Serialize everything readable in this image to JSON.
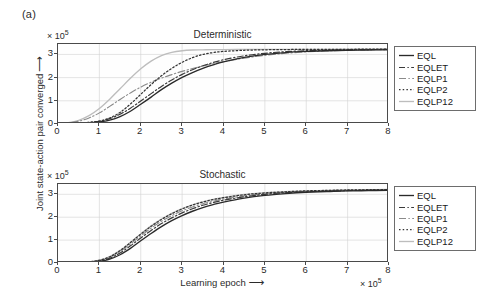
{
  "figure": {
    "panel_label": "(a)",
    "ylabel": "Joint state-action pair converged",
    "ylabel_arrow": "⟶",
    "xlabel": "Learning epoch",
    "xlabel_arrow": "⟶",
    "exponent": "× 10",
    "exponent_sup": "5"
  },
  "series_styles": {
    "EQL": {
      "color": "#2a2a2a",
      "width": 1.35,
      "dash": "none"
    },
    "EQLET": {
      "color": "#3a3a3a",
      "width": 1.2,
      "dash": "6,2.4,1.4,2.4"
    },
    "EQLP1": {
      "color": "#8a8a8a",
      "width": 1.1,
      "dash": "7,2.4,1.4,2.4"
    },
    "EQLP2": {
      "color": "#333333",
      "width": 1.25,
      "dash": "1.5,2.2"
    },
    "EQLP12": {
      "color": "#bdbdbd",
      "width": 1.35,
      "dash": "none"
    }
  },
  "chart_data": [
    {
      "type": "line",
      "title": "Deterministic",
      "xlabel": "Learning epoch",
      "ylabel": "Joint state-action pair converged",
      "x_scale_label": "× 10^5",
      "y_scale_label": "× 10^5",
      "xlim": [
        0,
        8
      ],
      "ylim": [
        0,
        3.45
      ],
      "xticks": [
        0,
        1,
        2,
        3,
        4,
        5,
        6,
        7,
        8
      ],
      "yticks": [
        0,
        1,
        2,
        3
      ],
      "grid": true,
      "legend_position": "right-outside",
      "x": [
        0,
        0.25,
        0.5,
        0.75,
        1.0,
        1.25,
        1.5,
        1.75,
        2.0,
        2.25,
        2.5,
        2.75,
        3.0,
        3.25,
        3.5,
        3.75,
        4.0,
        4.5,
        5.0,
        5.5,
        6.0,
        6.5,
        7.0,
        7.5,
        8.0
      ],
      "series": [
        {
          "name": "EQL",
          "values": [
            0.01,
            0.02,
            0.03,
            0.05,
            0.09,
            0.17,
            0.32,
            0.55,
            0.85,
            1.16,
            1.48,
            1.76,
            2.01,
            2.22,
            2.4,
            2.55,
            2.68,
            2.87,
            3.0,
            3.08,
            3.13,
            3.16,
            3.18,
            3.19,
            3.2
          ]
        },
        {
          "name": "EQLET",
          "values": [
            0.01,
            0.02,
            0.04,
            0.07,
            0.12,
            0.23,
            0.42,
            0.68,
            0.99,
            1.31,
            1.62,
            1.9,
            2.14,
            2.34,
            2.51,
            2.65,
            2.77,
            2.94,
            3.05,
            3.12,
            3.16,
            3.18,
            3.2,
            3.21,
            3.22
          ]
        },
        {
          "name": "EQLP1",
          "values": [
            0.02,
            0.05,
            0.12,
            0.26,
            0.48,
            0.76,
            1.06,
            1.34,
            1.59,
            1.8,
            1.98,
            2.13,
            2.27,
            2.39,
            2.5,
            2.6,
            2.69,
            2.84,
            2.96,
            3.05,
            3.11,
            3.15,
            3.18,
            3.2,
            3.21
          ]
        },
        {
          "name": "EQLP2",
          "values": [
            0.01,
            0.02,
            0.04,
            0.07,
            0.13,
            0.26,
            0.5,
            0.86,
            1.28,
            1.7,
            2.08,
            2.4,
            2.66,
            2.86,
            3.0,
            3.08,
            3.13,
            3.18,
            3.2,
            3.21,
            3.22,
            3.22,
            3.22,
            3.23,
            3.23
          ]
        },
        {
          "name": "EQLP12",
          "values": [
            0.02,
            0.06,
            0.16,
            0.36,
            0.67,
            1.07,
            1.52,
            1.97,
            2.38,
            2.71,
            2.95,
            3.09,
            3.16,
            3.19,
            3.2,
            3.21,
            3.21,
            3.22,
            3.22,
            3.22,
            3.22,
            3.22,
            3.23,
            3.23,
            3.23
          ]
        }
      ]
    },
    {
      "type": "line",
      "title": "Stochastic",
      "xlabel": "Learning epoch",
      "ylabel": "Joint state-action pair converged",
      "x_scale_label": "× 10^5",
      "y_scale_label": "× 10^5",
      "xlim": [
        0,
        8
      ],
      "ylim": [
        0,
        3.45
      ],
      "xticks": [
        0,
        1,
        2,
        3,
        4,
        5,
        6,
        7,
        8
      ],
      "yticks": [
        0,
        1,
        2,
        3
      ],
      "grid": true,
      "legend_position": "right-outside",
      "x": [
        0,
        0.25,
        0.5,
        0.75,
        1.0,
        1.25,
        1.5,
        1.75,
        2.0,
        2.25,
        2.5,
        2.75,
        3.0,
        3.25,
        3.5,
        3.75,
        4.0,
        4.5,
        5.0,
        5.5,
        6.0,
        6.5,
        7.0,
        7.5,
        8.0
      ],
      "series": [
        {
          "name": "EQL",
          "values": [
            0.0,
            0.01,
            0.01,
            0.03,
            0.07,
            0.17,
            0.36,
            0.64,
            0.97,
            1.29,
            1.59,
            1.85,
            2.07,
            2.26,
            2.42,
            2.55,
            2.66,
            2.83,
            2.95,
            3.03,
            3.09,
            3.12,
            3.15,
            3.16,
            3.17
          ]
        },
        {
          "name": "EQLET",
          "values": [
            0.0,
            0.01,
            0.02,
            0.04,
            0.09,
            0.21,
            0.44,
            0.75,
            1.09,
            1.42,
            1.72,
            1.97,
            2.19,
            2.37,
            2.52,
            2.64,
            2.74,
            2.89,
            3.0,
            3.07,
            3.11,
            3.14,
            3.16,
            3.18,
            3.19
          ]
        },
        {
          "name": "EQLP1",
          "values": [
            0.0,
            0.01,
            0.02,
            0.05,
            0.11,
            0.25,
            0.5,
            0.83,
            1.18,
            1.52,
            1.82,
            2.07,
            2.28,
            2.45,
            2.59,
            2.7,
            2.79,
            2.93,
            3.03,
            3.09,
            3.13,
            3.16,
            3.18,
            3.19,
            3.2
          ]
        },
        {
          "name": "EQLP2",
          "values": [
            0.0,
            0.01,
            0.02,
            0.05,
            0.12,
            0.27,
            0.54,
            0.89,
            1.26,
            1.6,
            1.9,
            2.15,
            2.36,
            2.53,
            2.66,
            2.77,
            2.85,
            2.98,
            3.06,
            3.11,
            3.15,
            3.17,
            3.19,
            3.2,
            3.21
          ]
        },
        {
          "name": "EQLP12",
          "values": [
            0.0,
            0.01,
            0.02,
            0.05,
            0.12,
            0.28,
            0.55,
            0.9,
            1.27,
            1.62,
            1.92,
            2.17,
            2.37,
            2.54,
            2.67,
            2.78,
            2.86,
            2.99,
            3.07,
            3.12,
            3.15,
            3.17,
            3.19,
            3.2,
            3.21
          ]
        }
      ]
    }
  ],
  "legend": {
    "entries": [
      {
        "label": "EQL"
      },
      {
        "label": "EQLET"
      },
      {
        "label": "EQLP1"
      },
      {
        "label": "EQLP2"
      },
      {
        "label": "EQLP12"
      }
    ]
  },
  "axes": {
    "xtick_labels": [
      "0",
      "1",
      "2",
      "3",
      "4",
      "5",
      "6",
      "7",
      "8"
    ],
    "ytick_labels": [
      "0",
      "1",
      "2",
      "3"
    ]
  }
}
